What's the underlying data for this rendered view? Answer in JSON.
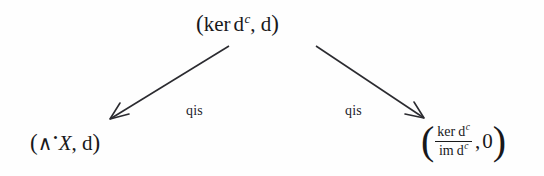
{
  "diagram": {
    "type": "commutative-diagram",
    "background_color": "#fefefe",
    "ink_color": "#1a1a1a",
    "nodes": {
      "top": {
        "open_paren": "(",
        "ker": "ker",
        "d": "d",
        "d_superscript": "c",
        "comma": ", ",
        "second": "d",
        "close_paren": ")",
        "plain_text": "(ker d^c, d)"
      },
      "bottom_left": {
        "open_paren": "(",
        "wedge": "∧",
        "bullet": "•",
        "variable": "X",
        "comma": ", ",
        "second": "d",
        "close_paren": ")",
        "plain_text": "(∧•X, d)"
      },
      "bottom_right": {
        "open_paren": "(",
        "numerator_ker": "ker",
        "numerator_d": "d",
        "numerator_superscript": "c",
        "denominator_im": "im",
        "denominator_d": "d",
        "denominator_superscript": "c",
        "comma": ", ",
        "second": "0",
        "close_paren": ")",
        "plain_text": "(ker d^c / im d^c, 0)"
      }
    },
    "arrows": [
      {
        "name": "arrow-left",
        "label": "qis",
        "from": "top",
        "to": "bottom_left",
        "direction": "down-left"
      },
      {
        "name": "arrow-right",
        "label": "qis",
        "from": "top",
        "to": "bottom_right",
        "direction": "down-right"
      }
    ]
  }
}
